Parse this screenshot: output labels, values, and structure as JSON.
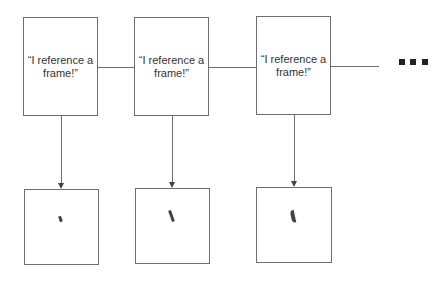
{
  "diagram": {
    "frames": [
      {
        "label": "“I reference a frame!”"
      },
      {
        "label": "“I reference a frame!”"
      },
      {
        "label": "“I reference a frame!”"
      }
    ],
    "results": [
      {
        "mark": "short-stroke"
      },
      {
        "mark": "longer-stroke"
      },
      {
        "mark": "curved-stroke"
      }
    ],
    "continuation": "ellipsis-squares",
    "colors": {
      "line": "#6e6e6e",
      "mark": "#444444",
      "dots": "#222222"
    }
  }
}
